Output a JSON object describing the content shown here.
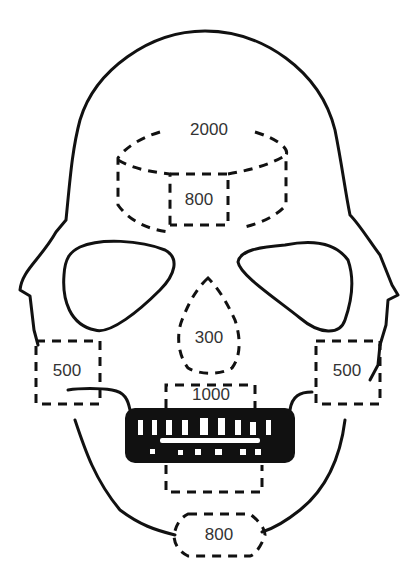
{
  "diagram": {
    "regions": [
      {
        "id": "vertex",
        "label": "2000",
        "x": 209,
        "y": 130
      },
      {
        "id": "forehead",
        "label": "800",
        "x": 199,
        "y": 200
      },
      {
        "id": "nasal",
        "label": "300",
        "x": 209,
        "y": 338
      },
      {
        "id": "cheek-left",
        "label": "500",
        "x": 67,
        "y": 371
      },
      {
        "id": "cheek-right",
        "label": "500",
        "x": 347,
        "y": 371
      },
      {
        "id": "maxilla",
        "label": "1000",
        "x": 211,
        "y": 395
      },
      {
        "id": "chin",
        "label": "800",
        "x": 219,
        "y": 535
      }
    ],
    "colors": {
      "line": "#111111",
      "text": "#333333",
      "background": "#ffffff"
    }
  }
}
